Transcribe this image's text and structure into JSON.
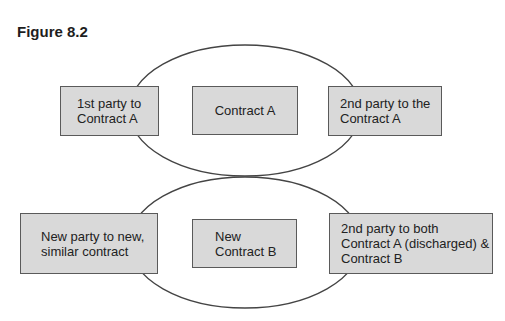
{
  "figure": {
    "title": "Figure 8.2"
  },
  "diagram": {
    "top_group": {
      "left_box": {
        "lines": [
          "1st party to",
          "Contract A"
        ]
      },
      "center_box": {
        "lines": [
          "Contract A"
        ]
      },
      "right_box": {
        "lines": [
          "2nd party to the",
          "Contract A"
        ]
      }
    },
    "bottom_group": {
      "left_box": {
        "lines": [
          "New party to new,",
          "similar contract"
        ]
      },
      "center_box": {
        "lines": [
          "New",
          "Contract B"
        ]
      },
      "right_box": {
        "lines": [
          "2nd party to both",
          "Contract A (discharged) &",
          "Contract B"
        ]
      }
    },
    "colors": {
      "box_fill": "#d9d9d9",
      "box_border": "#5a5a5a",
      "ellipse_stroke": "#444444"
    }
  }
}
